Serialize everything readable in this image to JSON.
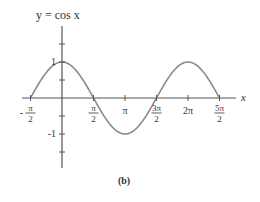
{
  "chart_data": {
    "type": "line",
    "title": "y = cos x",
    "caption": "(b)",
    "xlabel": "x",
    "ylabel": "y",
    "function": "cos(x)",
    "x_range": [
      -1.5708,
      7.854
    ],
    "ylim": [
      -1.5,
      1.5
    ],
    "grid": false,
    "legend": null,
    "x_ticks": [
      {
        "value": -1.5708,
        "label_num": "π",
        "label_den": "2",
        "sign": "-"
      },
      {
        "value": 1.5708,
        "label_num": "π",
        "label_den": "2",
        "sign": ""
      },
      {
        "value": 3.1416,
        "label": "π"
      },
      {
        "value": 4.7124,
        "label_num": "3π",
        "label_den": "2",
        "sign": ""
      },
      {
        "value": 6.2832,
        "label": "2π"
      },
      {
        "value": 7.854,
        "label_num": "5π",
        "label_den": "2",
        "sign": ""
      }
    ],
    "y_ticks": [
      {
        "value": 1.5,
        "label": ""
      },
      {
        "value": 1,
        "label": "1"
      },
      {
        "value": 0.5,
        "label": ""
      },
      {
        "value": -0.5,
        "label": ""
      },
      {
        "value": -1,
        "label": "-1"
      },
      {
        "value": -1.5,
        "label": ""
      }
    ],
    "series": [
      {
        "name": "cos x",
        "color": "#8a8a8a",
        "x": [
          -1.5708,
          0,
          1.5708,
          3.1416,
          4.7124,
          6.2832,
          7.854
        ],
        "y": [
          0,
          1,
          0,
          -1,
          0,
          1,
          0
        ]
      }
    ],
    "axis_color": "#555555"
  }
}
